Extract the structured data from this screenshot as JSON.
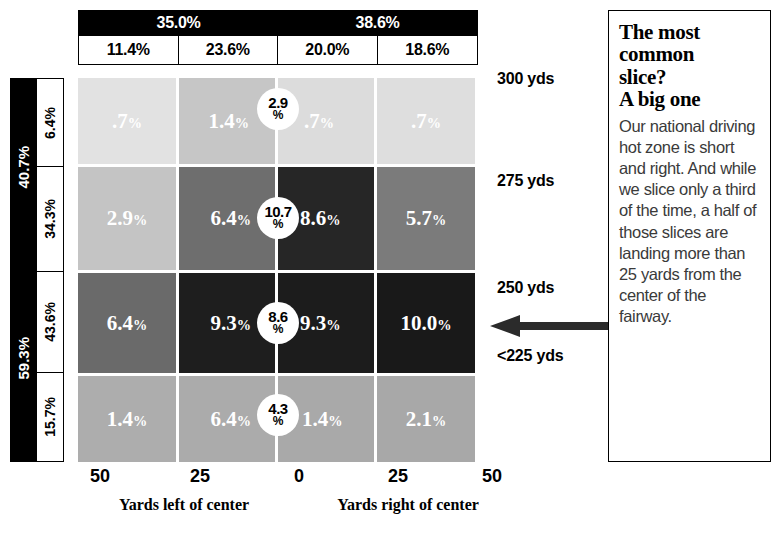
{
  "chart_data": {
    "type": "heatmap",
    "title": "The most common slice? A big one",
    "xlabel": "Yards left of center / Yards right of center",
    "ylabel": "Driving distance (yds)",
    "x_tick_labels": [
      "50",
      "25",
      "0",
      "25",
      "50"
    ],
    "x_axis_captions": [
      "Yards left of center",
      "Yards right of center"
    ],
    "column_group_headers": [
      {
        "label": "35.0%",
        "span": 2
      },
      {
        "label": "38.6%",
        "span": 2
      }
    ],
    "column_headers": [
      "11.4%",
      "23.6%",
      "20.0%",
      "18.6%"
    ],
    "row_group_headers": [
      {
        "label": "40.7%",
        "span": 2
      },
      {
        "label": "59.3%",
        "span": 2
      }
    ],
    "row_headers": [
      "6.4%",
      "34.3%",
      "43.6%",
      "15.7%"
    ],
    "row_distance_labels": [
      "300 yds",
      "275 yds",
      "250 yds",
      "<225 yds"
    ],
    "center_badges": [
      "2.9\n%",
      "10.7\n%",
      "8.6\n%",
      "4.3\n%"
    ],
    "rows": [
      {
        "distance": "300 yds",
        "row_pct": "6.4%",
        "cells": [
          {
            "value": ".7%",
            "num": 0.7,
            "shade": "#e2e2e2"
          },
          {
            "value": "1.4%",
            "num": 1.4,
            "shade": "#c6c6c6"
          },
          {
            "value": ".7%",
            "num": 0.7,
            "shade": "#dcdcdc"
          },
          {
            "value": ".7%",
            "num": 0.7,
            "shade": "#dedede"
          }
        ],
        "badge_top": "2.9",
        "badge_bottom": "%"
      },
      {
        "distance": "275 yds",
        "row_pct": "34.3%",
        "cells": [
          {
            "value": "2.9%",
            "num": 2.9,
            "shade": "#c4c4c4"
          },
          {
            "value": "6.4%",
            "num": 6.4,
            "shade": "#6e6e6e"
          },
          {
            "value": "8.6%",
            "num": 8.6,
            "shade": "#262626"
          },
          {
            "value": "5.7%",
            "num": 5.7,
            "shade": "#7b7b7b"
          }
        ],
        "badge_top": "10.7",
        "badge_bottom": "%"
      },
      {
        "distance": "250 yds",
        "row_pct": "43.6%",
        "cells": [
          {
            "value": "6.4%",
            "num": 6.4,
            "shade": "#6a6a6a"
          },
          {
            "value": "9.3%",
            "num": 9.3,
            "shade": "#1e1e1e"
          },
          {
            "value": "9.3%",
            "num": 9.3,
            "shade": "#1c1c1c"
          },
          {
            "value": "10.0%",
            "num": 10.0,
            "shade": "#191919"
          }
        ],
        "badge_top": "8.6",
        "badge_bottom": "%"
      },
      {
        "distance": "<225 yds",
        "row_pct": "15.7%",
        "cells": [
          {
            "value": "1.4%",
            "num": 1.4,
            "shade": "#adadad"
          },
          {
            "value": "6.4%",
            "num": 6.4,
            "shade": "#ababab"
          },
          {
            "value": "1.4%",
            "num": 1.4,
            "shade": "#a9a9a9"
          },
          {
            "value": "2.1%",
            "num": 2.1,
            "shade": "#a8a8a8"
          }
        ],
        "badge_top": "4.3",
        "badge_bottom": "%"
      }
    ]
  },
  "callout": {
    "headline_lines": [
      "The most",
      "common",
      "slice?",
      "A big one"
    ],
    "headline": "The most common slice? A big one",
    "body": "Our national driving hot zone is short and right. And while we slice only a third of the time, a half of those slices are landing more than 25 yards from the center of the fairway."
  },
  "arrow": {
    "direction": "left",
    "color": "#2b2b2b"
  }
}
